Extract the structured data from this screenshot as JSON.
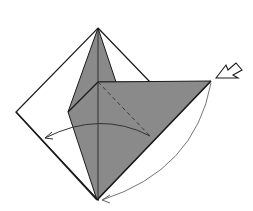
{
  "diagram": {
    "colors": {
      "background": "#ffffff",
      "paper_front": "#ffffff",
      "paper_back": "#8a8a8a",
      "line": "#1a1a1a",
      "arrow": "#555555"
    },
    "elements": [
      {
        "name": "square-outline",
        "type": "diamond",
        "points": [
          [
            98,
            28
          ],
          [
            150,
            82
          ],
          [
            211,
            81
          ],
          [
            97,
            200
          ],
          [
            16,
            112
          ]
        ]
      },
      {
        "name": "gray-flap-upper",
        "type": "polygon"
      },
      {
        "name": "gray-flap-main",
        "type": "polygon"
      },
      {
        "name": "valley-fold-dashed-line",
        "type": "dashed-line"
      },
      {
        "name": "fold-arrow-left",
        "type": "arc-arrow"
      },
      {
        "name": "fold-arrow-bottom",
        "type": "arc-arrow"
      },
      {
        "name": "push-arrow",
        "type": "hollow-arrow"
      }
    ]
  }
}
